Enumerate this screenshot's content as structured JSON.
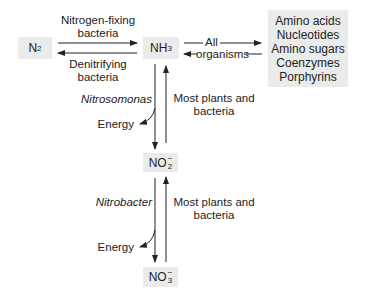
{
  "nodes": {
    "n2": {
      "base": "N",
      "sub": "2"
    },
    "nh3": {
      "base": "NH",
      "sub": "3"
    },
    "no2": {
      "base": "NO",
      "sub": "2",
      "sup": "−"
    },
    "no3": {
      "base": "NO",
      "sub": "3",
      "sup": "−"
    },
    "compounds": [
      "Amino acids",
      "Nucleotides",
      "Amino sugars",
      "Coenzymes",
      "Porphyrins"
    ]
  },
  "labels": {
    "nitrogen_fixing": [
      "Nitrogen-fixing",
      "bacteria"
    ],
    "denitrifying": [
      "Denitrifying",
      "bacteria"
    ],
    "all_organisms_top": "All",
    "all_organisms_bottom": "organisms",
    "nitrosomonas": "Nitrosomonas",
    "nitrobacter": "Nitrobacter",
    "energy_1": "Energy",
    "energy_2": "Energy",
    "plants_1": [
      "Most plants and",
      "bacteria"
    ],
    "plants_2": [
      "Most plants and",
      "bacteria"
    ]
  },
  "colors": {
    "box_fill": "#ebebeb",
    "line": "#222222"
  }
}
